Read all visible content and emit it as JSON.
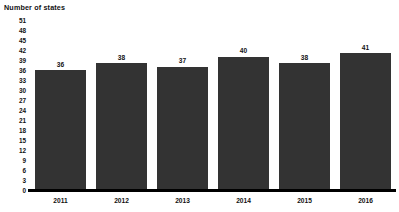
{
  "chart_data": {
    "type": "bar",
    "title": "Number of states",
    "xlabel": "",
    "ylabel": "Number of states",
    "categories": [
      "2011",
      "2012",
      "2013",
      "2014",
      "2015",
      "2016"
    ],
    "values": [
      36,
      38,
      37,
      40,
      38,
      41
    ],
    "data_labels": [
      "36",
      "38",
      "37",
      "40",
      "38",
      "41"
    ],
    "ylim": [
      0,
      51
    ],
    "ytick_step": 3,
    "yticks": [
      51,
      48,
      45,
      42,
      39,
      36,
      33,
      30,
      27,
      24,
      21,
      18,
      15,
      12,
      9,
      6,
      3,
      0
    ],
    "ytick_labels": [
      "51",
      "48",
      "45",
      "42",
      "39",
      "36",
      "33",
      "30",
      "27",
      "24",
      "21",
      "18",
      "15",
      "12",
      "9",
      "6",
      "3",
      "0"
    ],
    "grid": false,
    "legend": null,
    "legend_position": "none",
    "bar_color": "#333333",
    "axis_color": "#000000",
    "background_color": "#ffffff",
    "text_color": "#111111"
  }
}
